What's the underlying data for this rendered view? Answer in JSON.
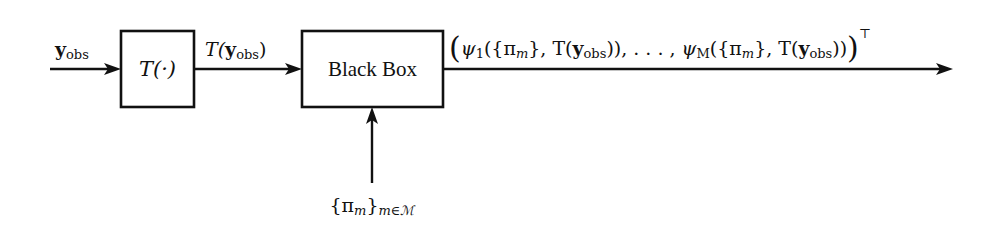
{
  "diagram": {
    "input": {
      "label_main": "y",
      "label_sub": "obs"
    },
    "transform_block": {
      "label": "T(·)"
    },
    "transform_output": {
      "label_prefix": "T(",
      "label_main": "y",
      "label_sub": "obs",
      "label_suffix": ")"
    },
    "black_box": {
      "label": "Black Box"
    },
    "prior_input": {
      "label_main": "{π",
      "label_m": "m",
      "label_close": "}",
      "label_sub": "m∈ℳ"
    },
    "output": {
      "open_paren": "(",
      "psi1": "ψ",
      "psi1_sub": "1",
      "term1_open": "({π",
      "term1_m": "m",
      "term1_mid": "}, T(",
      "term1_y": "y",
      "term1_obs": "obs",
      "term1_close": ")),",
      "ellipsis": " . . . ,",
      "psiM": "ψ",
      "psiM_sub": "M",
      "termM_open": "({π",
      "termM_m": "m",
      "termM_mid": "}, T(",
      "termM_y": "y",
      "termM_obs": "obs",
      "termM_close": "))",
      "close_paren": ")",
      "transpose": "⊤"
    },
    "colors": {
      "stroke": "#111111",
      "background": "#ffffff"
    }
  }
}
